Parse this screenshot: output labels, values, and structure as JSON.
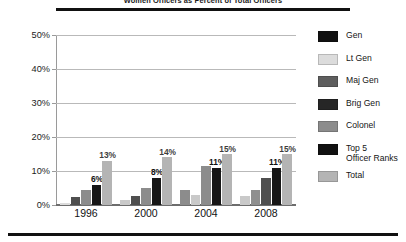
{
  "header": {
    "title": "Women Officers as Percent of Total Officers"
  },
  "legend": {
    "items": [
      {
        "label": "Gen",
        "color": "#111111"
      },
      {
        "label": "Lt Gen",
        "color": "#dcdcdc"
      },
      {
        "label": "Maj Gen",
        "color": "#5e5e5e"
      },
      {
        "label": "Brig Gen",
        "color": "#262626"
      },
      {
        "label": "Colonel",
        "color": "#8c8c8c"
      },
      {
        "label": "Top 5\nOfficer Ranks",
        "color": "#111111"
      },
      {
        "label": "Total",
        "color": "#b4b4b4"
      }
    ]
  },
  "chart_data": {
    "type": "bar",
    "title": "Women Officers as Percent of Total Officers",
    "xlabel": "",
    "ylabel": "",
    "ylim": [
      0,
      50
    ],
    "yticks": [
      "0%",
      "10%",
      "20%",
      "30%",
      "40%",
      "50%"
    ],
    "ytick_values": [
      0,
      10,
      20,
      30,
      40,
      50
    ],
    "grid": true,
    "legend_position": "right",
    "categories": [
      "1996",
      "2000",
      "2004",
      "2008"
    ],
    "series": [
      {
        "name": "Gen",
        "color": "#111111",
        "values": [
          0.4,
          0.4,
          0.5,
          1.5
        ]
      },
      {
        "name": "Lt Gen",
        "color": "#dcdcdc",
        "values": [
          0.5,
          1.5,
          4.5,
          2.5
        ]
      },
      {
        "name": "Maj Gen",
        "color": "#5e5e5e",
        "values": [
          2.5,
          2.5,
          3.0,
          4.5
        ]
      },
      {
        "name": "Brig Gen",
        "color": "#262626",
        "values": [
          4.0,
          5.0,
          11.0,
          8.0
        ]
      },
      {
        "name": "Colonel",
        "color": "#8c8c8c",
        "values": [
          5.5,
          7.5,
          11.5,
          11.5
        ]
      },
      {
        "name": "Top 5 Officer Ranks",
        "color": "#111111",
        "values": [
          6.0,
          8.0,
          11.0,
          11.0
        ]
      },
      {
        "name": "Total",
        "color": "#b4b4b4",
        "values": [
          13.0,
          14.0,
          15.0,
          15.0
        ]
      }
    ],
    "groups": [
      {
        "category": "1996",
        "bars": [
          {
            "series": "Lt Gen",
            "value": 0.5,
            "color": "#dcdcdc",
            "label": ""
          },
          {
            "series": "Maj Gen",
            "value": 2.5,
            "color": "#4f4f4f",
            "label": ""
          },
          {
            "series": "Colonel",
            "value": 4.3,
            "color": "#8c8c8c",
            "label": ""
          },
          {
            "series": "Top 5 Officer Ranks",
            "value": 6.0,
            "color": "#161616",
            "label": "6%"
          },
          {
            "series": "Total",
            "value": 13.0,
            "color": "#b4b4b4",
            "label": "13%"
          }
        ]
      },
      {
        "category": "2000",
        "bars": [
          {
            "series": "Lt Gen",
            "value": 1.4,
            "color": "#c9c9c9",
            "label": ""
          },
          {
            "series": "Maj Gen",
            "value": 2.6,
            "color": "#4f4f4f",
            "label": ""
          },
          {
            "series": "Colonel",
            "value": 5.1,
            "color": "#8c8c8c",
            "label": ""
          },
          {
            "series": "Top 5 Officer Ranks",
            "value": 8.0,
            "color": "#161616",
            "label": "8%"
          },
          {
            "series": "Total",
            "value": 14.0,
            "color": "#b4b4b4",
            "label": "14%"
          }
        ]
      },
      {
        "category": "2004",
        "bars": [
          {
            "series": "Lt Gen",
            "value": 4.4,
            "color": "#8c8c8c",
            "label": ""
          },
          {
            "series": "Maj Gen",
            "value": 2.9,
            "color": "#c9c9c9",
            "label": ""
          },
          {
            "series": "Colonel",
            "value": 11.5,
            "color": "#8c8c8c",
            "label": ""
          },
          {
            "series": "Top 5 Officer Ranks",
            "value": 11.0,
            "color": "#161616",
            "label": "11%"
          },
          {
            "series": "Total",
            "value": 15.0,
            "color": "#b4b4b4",
            "label": "15%"
          }
        ]
      },
      {
        "category": "2008",
        "bars": [
          {
            "series": "Lt Gen",
            "value": 2.6,
            "color": "#c9c9c9",
            "label": ""
          },
          {
            "series": "Maj Gen",
            "value": 4.3,
            "color": "#8f8f8f",
            "label": ""
          },
          {
            "series": "Colonel",
            "value": 8.0,
            "color": "#4f4f4f",
            "label": ""
          },
          {
            "series": "Top 5 Officer Ranks",
            "value": 11.0,
            "color": "#161616",
            "label": "11%"
          },
          {
            "series": "Total",
            "value": 15.0,
            "color": "#b4b4b4",
            "label": "15%"
          }
        ]
      }
    ]
  }
}
